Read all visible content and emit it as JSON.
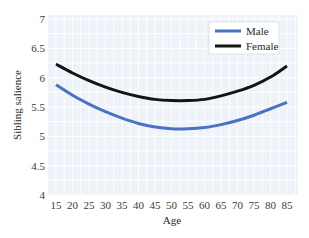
{
  "chart_data": {
    "type": "line",
    "title": "",
    "xlabel": "Age",
    "ylabel": "Sibling salience",
    "x": [
      15,
      20,
      25,
      30,
      35,
      40,
      45,
      50,
      55,
      60,
      65,
      70,
      75,
      80,
      85
    ],
    "x_tick_labels": [
      "15",
      "20",
      "25",
      "30",
      "35",
      "40",
      "45",
      "50",
      "55",
      "60",
      "65",
      "70",
      "75",
      "80",
      "85"
    ],
    "y_tick_labels": [
      "4",
      "4.5",
      "5",
      "5.5",
      "6",
      "6.5",
      "7"
    ],
    "y_ticks": [
      4,
      4.5,
      5,
      5.5,
      6,
      6.5,
      7
    ],
    "xlim": [
      15,
      85
    ],
    "ylim": [
      4,
      7
    ],
    "grid": true,
    "legend_position": "upper right",
    "series": [
      {
        "name": "Male",
        "color": "#4a72c4",
        "values": [
          5.88,
          5.7,
          5.55,
          5.42,
          5.31,
          5.22,
          5.16,
          5.13,
          5.13,
          5.15,
          5.2,
          5.27,
          5.36,
          5.47,
          5.58
        ]
      },
      {
        "name": "Female",
        "color": "#141414",
        "values": [
          6.23,
          6.08,
          5.95,
          5.84,
          5.75,
          5.68,
          5.63,
          5.61,
          5.61,
          5.63,
          5.69,
          5.77,
          5.87,
          6.01,
          6.2
        ]
      }
    ]
  },
  "colors": {
    "plot_background": "#edf3f9",
    "grid": "#ffffff",
    "legend_background": "#ffffff"
  }
}
